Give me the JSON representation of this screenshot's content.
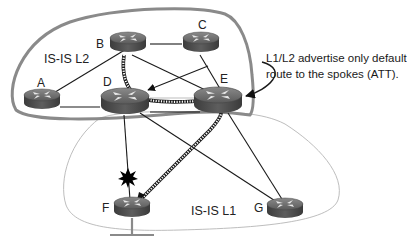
{
  "diagram": {
    "areas": [
      {
        "id": "l2",
        "label": "IS-IS L2"
      },
      {
        "id": "l1",
        "label": "IS-IS L1"
      }
    ],
    "routers": [
      {
        "id": "A",
        "label": "A",
        "role": "L2"
      },
      {
        "id": "B",
        "label": "B",
        "role": "L2"
      },
      {
        "id": "C",
        "label": "C",
        "role": "L2"
      },
      {
        "id": "D",
        "label": "D",
        "role": "L1/L2"
      },
      {
        "id": "E",
        "label": "E",
        "role": "L1/L2"
      },
      {
        "id": "F",
        "label": "F",
        "role": "L1 spoke"
      },
      {
        "id": "G",
        "label": "G",
        "role": "L1 spoke"
      }
    ],
    "links": [
      {
        "from": "A",
        "to": "B"
      },
      {
        "from": "A",
        "to": "D"
      },
      {
        "from": "B",
        "to": "C"
      },
      {
        "from": "B",
        "to": "D",
        "style": "dotted-path"
      },
      {
        "from": "B",
        "to": "E"
      },
      {
        "from": "C",
        "to": "D",
        "style": "arrow"
      },
      {
        "from": "C",
        "to": "E"
      },
      {
        "from": "D",
        "to": "E",
        "style": "dotted-path"
      },
      {
        "from": "D",
        "to": "F",
        "status": "failed"
      },
      {
        "from": "D",
        "to": "G"
      },
      {
        "from": "E",
        "to": "F",
        "style": "dotted-path-arrow"
      },
      {
        "from": "E",
        "to": "G"
      }
    ],
    "annotation": {
      "line1": "L1/L2 advertise only default",
      "line2": "route to the spokes (ATT)."
    },
    "failure_marker": "starburst-icon"
  }
}
